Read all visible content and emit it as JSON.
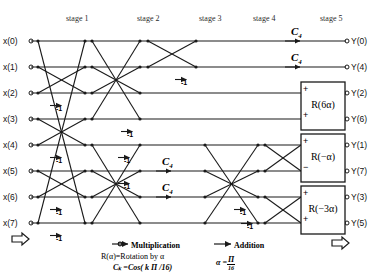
{
  "figure": {
    "stage_labels": [
      {
        "text": "stage 1",
        "x": 66
      },
      {
        "text": "stage 2",
        "x": 137
      },
      {
        "text": "stage 3",
        "x": 199
      },
      {
        "text": "stage 4",
        "x": 253
      },
      {
        "text": "stage 5",
        "x": 320
      }
    ],
    "inputs": [
      {
        "label": "x(0)",
        "y": 41
      },
      {
        "label": "x(1)",
        "y": 67
      },
      {
        "label": "x(2)",
        "y": 93
      },
      {
        "label": "x(3)",
        "y": 119
      },
      {
        "label": "x(4)",
        "y": 145
      },
      {
        "label": "x(5)",
        "y": 171
      },
      {
        "label": "x(6)",
        "y": 197
      },
      {
        "label": "x(7)",
        "y": 223
      }
    ],
    "outputs": [
      {
        "label": "Y(0)",
        "y": 41
      },
      {
        "label": "Y(4)",
        "y": 67
      },
      {
        "label": "Y(2)",
        "y": 93
      },
      {
        "label": "Y(6)",
        "y": 119
      },
      {
        "label": "Y(1)",
        "y": 145
      },
      {
        "label": "Y(7)",
        "y": 171
      },
      {
        "label": "Y(3)",
        "y": 197
      },
      {
        "label": "Y(5)",
        "y": 223
      }
    ],
    "minus_one_labels": [
      {
        "text": "-1",
        "x": 60,
        "y": 100
      },
      {
        "text": "-1",
        "x": 60,
        "y": 152
      },
      {
        "text": "-1",
        "x": 60,
        "y": 204
      },
      {
        "text": "-1",
        "x": 60,
        "y": 230
      },
      {
        "text": "-1",
        "x": 131,
        "y": 126
      },
      {
        "text": "-1",
        "x": 128,
        "y": 152
      },
      {
        "text": "-1",
        "x": 128,
        "y": 178
      },
      {
        "text": "-1",
        "x": 185,
        "y": 74
      },
      {
        "text": "-1",
        "x": 244,
        "y": 204
      },
      {
        "text": "-1",
        "x": 251,
        "y": 218
      }
    ],
    "ck_labels": [
      {
        "text": "C",
        "sub": "4",
        "x": 168,
        "y": 155
      },
      {
        "text": "C",
        "sub": "4",
        "x": 168,
        "y": 181
      },
      {
        "text": "C",
        "sub": "4",
        "x": 297,
        "y": 25
      },
      {
        "text": "C",
        "sub": "4",
        "x": 297,
        "y": 51
      }
    ],
    "rotation_blocks": [
      {
        "label": "R(6α)",
        "x": 301,
        "y": 82,
        "w": 44,
        "h": 48,
        "top_sign": "+",
        "bottom_sign": "+",
        "in_top_y": 93,
        "in_bottom_y": 119
      },
      {
        "label": "R(−α)",
        "x": 301,
        "y": 134,
        "w": 44,
        "h": 48,
        "top_sign": "+",
        "bottom_sign": "−",
        "in_top_y": 145,
        "in_bottom_y": 171
      },
      {
        "label": "R(−3α)",
        "x": 301,
        "y": 186,
        "w": 44,
        "h": 48,
        "top_sign": "+",
        "bottom_sign": "+",
        "in_top_y": 197,
        "in_bottom_y": 223
      }
    ],
    "legend": {
      "multiplication": "Multiplication",
      "addition": "Addition",
      "rotation": "R(α)=Rotation by α",
      "cosine": "Cₖ =Cos( k Π /16)",
      "alpha_lhs": "α =",
      "alpha_num": "Π",
      "alpha_den": "16"
    },
    "colors": {
      "line": "#1a1a1a",
      "text": "#111111",
      "background": "#ffffff"
    }
  }
}
